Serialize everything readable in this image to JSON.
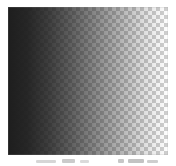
{
  "figure": {
    "name": "alpha-gradient-swatch",
    "canvas": {
      "width": 176,
      "height": 166,
      "background_color": "#ffffff"
    },
    "swatch": {
      "x": 8,
      "y": 7,
      "width": 160,
      "height": 148
    },
    "checkerboard": {
      "cell_size_px": 4,
      "light_color": "#ffffff",
      "dark_color": "#d0d0d0"
    },
    "gradient": {
      "type": "linear",
      "direction": "to right",
      "ink_color": "#1e1e1e",
      "stops": [
        {
          "position_pct": 0,
          "alpha": 1.0
        },
        {
          "position_pct": 12,
          "alpha": 0.96
        },
        {
          "position_pct": 25,
          "alpha": 0.86
        },
        {
          "position_pct": 40,
          "alpha": 0.7
        },
        {
          "position_pct": 55,
          "alpha": 0.52
        },
        {
          "position_pct": 70,
          "alpha": 0.34
        },
        {
          "position_pct": 85,
          "alpha": 0.15
        },
        {
          "position_pct": 100,
          "alpha": 0.0
        }
      ]
    }
  },
  "caption_remnant": {
    "visible": true,
    "legible": false,
    "note": "faint cropped text smudges"
  }
}
